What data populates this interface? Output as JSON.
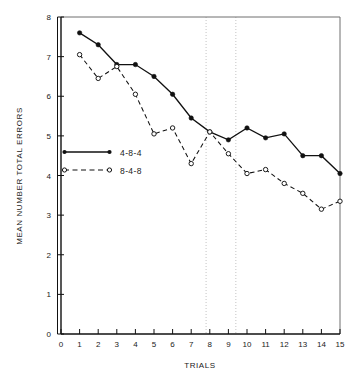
{
  "chart_data": {
    "type": "line",
    "title": "",
    "xlabel": "TRIALS",
    "ylabel": "MEAN NUMBER TOTAL ERRORS",
    "xlim": [
      0,
      15
    ],
    "ylim": [
      0,
      8
    ],
    "xticks": [
      0,
      1,
      2,
      3,
      4,
      5,
      6,
      7,
      8,
      9,
      10,
      11,
      12,
      13,
      14,
      15
    ],
    "xtick_labels": [
      "0",
      "1",
      "2",
      "3",
      "4",
      "5",
      "6",
      "7",
      "8",
      "9",
      "10",
      "11",
      "12",
      "13",
      "14",
      "15"
    ],
    "yticks": [
      0,
      1,
      2,
      3,
      4,
      5,
      6,
      7,
      8
    ],
    "ytick_labels": [
      "0",
      "1",
      "2",
      "3",
      "4",
      "5",
      "6",
      "7",
      "8"
    ],
    "grid": false,
    "vertical_reference_lines": [
      7.8,
      9.4
    ],
    "legend_position": "inside-left",
    "x": [
      1,
      2,
      3,
      4,
      5,
      6,
      7,
      8,
      9,
      10,
      11,
      12,
      13,
      14,
      15
    ],
    "series": [
      {
        "name": "4-8-4",
        "marker": "filled-circle",
        "line_style": "solid",
        "color": "#111111",
        "values": [
          7.6,
          7.3,
          6.8,
          6.8,
          6.5,
          6.05,
          5.45,
          5.1,
          4.9,
          5.2,
          4.95,
          5.05,
          4.5,
          4.5,
          4.05
        ]
      },
      {
        "name": "8-4-8",
        "marker": "open-circle",
        "line_style": "dashed",
        "color": "#111111",
        "values": [
          7.05,
          6.45,
          6.75,
          6.05,
          5.05,
          5.2,
          4.3,
          5.1,
          4.55,
          4.05,
          4.15,
          3.8,
          3.55,
          3.15,
          3.35
        ]
      }
    ]
  },
  "legend": {
    "entries": [
      {
        "label": "4-8-4"
      },
      {
        "label": "8-4-8"
      }
    ]
  },
  "axes": {
    "x_label": "TRIALS",
    "y_label": "MEAN NUMBER TOTAL ERRORS"
  }
}
